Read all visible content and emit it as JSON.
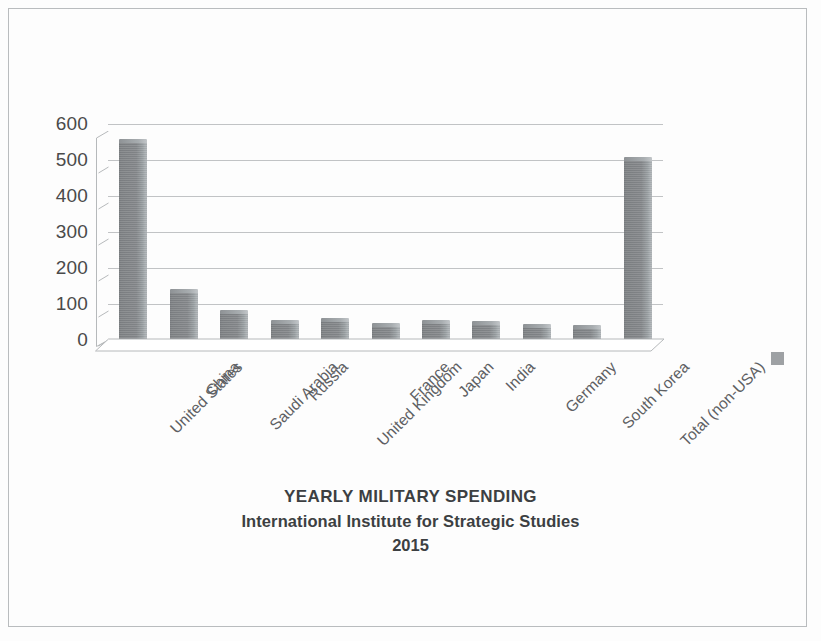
{
  "figure": {
    "width": 821,
    "height": 641,
    "background_color": "#fdfdfd",
    "border_color": "#b9bcbe"
  },
  "legend": {
    "swatch_color": "#8d9194",
    "swatch_label": ""
  },
  "chart_data": {
    "type": "bar",
    "title": "YEARLY MILITARY SPENDING",
    "subtitle": "International Institute for Strategic Studies",
    "year": "2015",
    "xlabel": "",
    "ylabel": "",
    "ylim": [
      0,
      650
    ],
    "ytick_labels": [
      "600",
      "500",
      "400",
      "300",
      "200",
      "100",
      "0"
    ],
    "ytick_values": [
      600,
      500,
      400,
      300,
      200,
      100,
      0
    ],
    "grid": true,
    "grid_axis": "y",
    "legend_position": "right",
    "bar_color": "#84878a",
    "categories": [
      "United States",
      "China",
      "Saudi Arabia",
      "Russia",
      "United Kingdom",
      "France",
      "Japan",
      "India",
      "Germany",
      "South Korea",
      "Total (non-USA)"
    ],
    "values": [
      597,
      145,
      82,
      51,
      56,
      41,
      51,
      48,
      39,
      36,
      541
    ],
    "series": [
      {
        "name": "Military spending",
        "values": [
          597,
          145,
          82,
          51,
          56,
          41,
          51,
          48,
          39,
          36,
          541
        ]
      }
    ]
  }
}
